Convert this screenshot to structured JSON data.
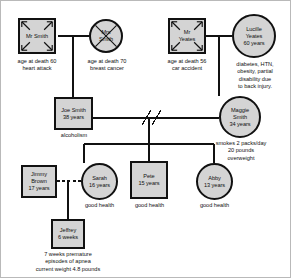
{
  "diagram": {
    "type": "genogram",
    "fill_color": "#d4d4d4",
    "line_color": "#111111",
    "background": "#ffffff"
  },
  "people": {
    "mr_smith": {
      "name": "Mr Smith",
      "shape": "square",
      "gender": "male",
      "deceased": true,
      "caption_lines": [
        "age at death 60",
        "heart attack"
      ]
    },
    "mrs_smith": {
      "name_line1": "Mrs",
      "name_line2": "Smith",
      "shape": "circle",
      "gender": "female",
      "deceased": true,
      "caption_lines": [
        "age at death 70",
        "breast cancer"
      ]
    },
    "mr_yeates": {
      "name_line1": "Mr",
      "name_line2": "Yeates",
      "shape": "square",
      "gender": "male",
      "deceased": true,
      "caption_lines": [
        "age at death 56",
        "car accident"
      ]
    },
    "lucille_yeates": {
      "name_line1": "Lucille",
      "name_line2": "Yeates",
      "age": "60 years",
      "shape": "circle",
      "gender": "female",
      "deceased": false,
      "caption_lines": [
        "diabetes, HTN,",
        "obesity, partial",
        "disability due",
        "to back  injury."
      ]
    },
    "joe_smith": {
      "name": "Joe Smith",
      "age": "38 years",
      "shape": "square",
      "gender": "male",
      "deceased": false,
      "caption_lines": [
        "alcoholism"
      ]
    },
    "maggie_smith": {
      "name_line1": "Maggie",
      "name_line2": "Smith",
      "age": "34 years",
      "shape": "circle",
      "gender": "female",
      "deceased": false,
      "caption_lines": [
        "smokes 2 packs/day",
        "20 pounds",
        "overweight"
      ]
    },
    "jimmy_brown": {
      "name_line1": "Jimmy",
      "name_line2": "Brown",
      "age": "17 years",
      "shape": "square",
      "gender": "male",
      "deceased": false,
      "caption_lines": []
    },
    "sarah": {
      "name": "Sarah",
      "age": "16 years",
      "shape": "circle",
      "gender": "female",
      "deceased": false,
      "caption_lines": [
        "good health"
      ]
    },
    "pete": {
      "name": "Pete",
      "age": "15 years",
      "shape": "square",
      "gender": "male",
      "deceased": false,
      "caption_lines": [
        "good health"
      ]
    },
    "abby": {
      "name": "Abby",
      "age": "13 years",
      "shape": "circle",
      "gender": "female",
      "deceased": false,
      "caption_lines": [
        "good health"
      ]
    },
    "jeffrey": {
      "name": "Jeffrey",
      "age": "6 weeks",
      "shape": "square",
      "gender": "male",
      "deceased": false,
      "caption_lines": [
        "7 weeks premature",
        "episodes of apnea",
        "current weight 4.8 pounds"
      ]
    }
  },
  "relationships": {
    "smith_marriage": {
      "partners": [
        "mr_smith",
        "mrs_smith"
      ],
      "style": "solid"
    },
    "yeates_marriage": {
      "partners": [
        "mr_yeates",
        "lucille_yeates"
      ],
      "style": "solid"
    },
    "joe_maggie": {
      "partners": [
        "joe_smith",
        "maggie_smith"
      ],
      "style": "divorced",
      "marks": 2
    },
    "jimmy_sarah": {
      "partners": [
        "jimmy_brown",
        "sarah"
      ],
      "style": "dashed"
    }
  },
  "children": {
    "joe_maggie": [
      "sarah",
      "pete",
      "abby"
    ],
    "jimmy_sarah": [
      "jeffrey"
    ],
    "smith_marriage": [
      "joe_smith"
    ],
    "yeates_marriage": [
      "maggie_smith"
    ]
  }
}
